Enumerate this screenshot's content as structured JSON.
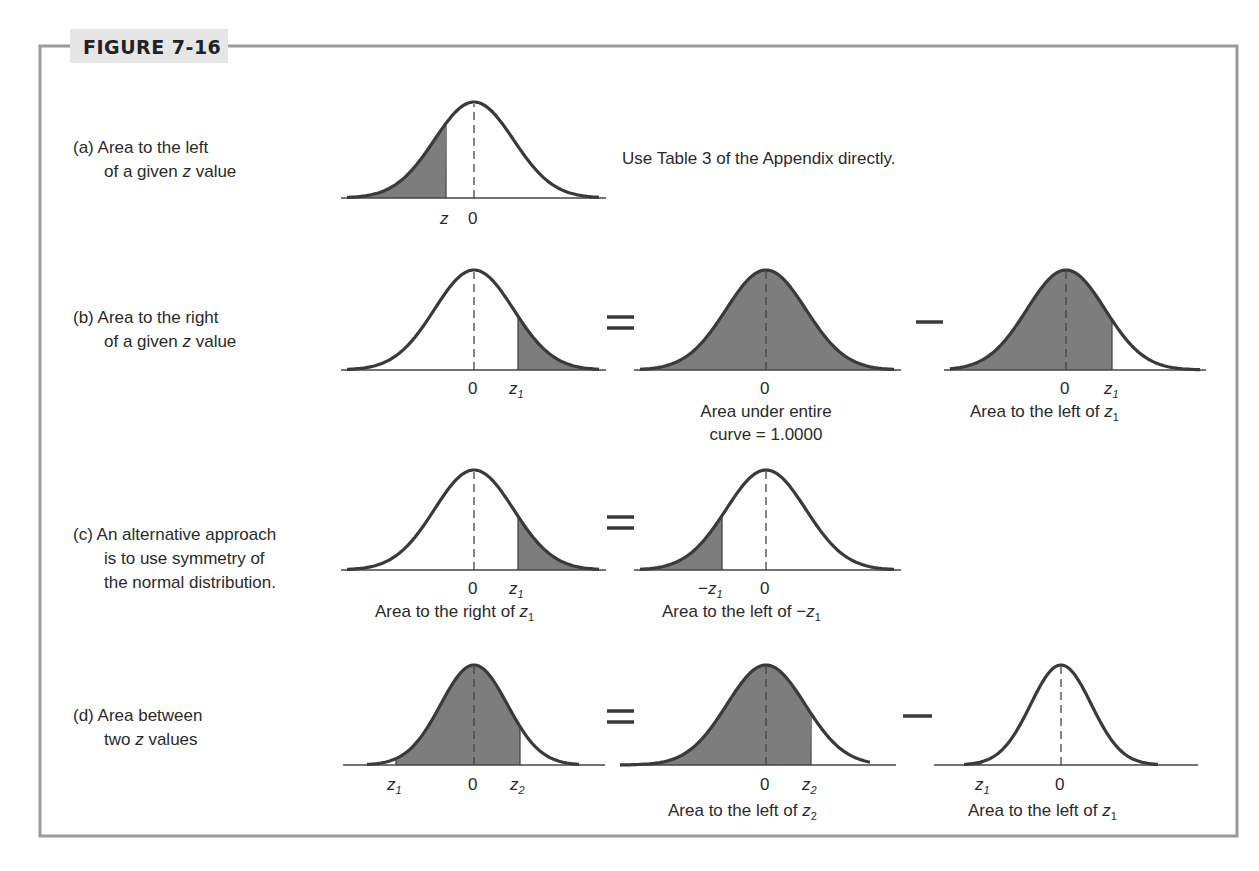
{
  "figure": {
    "title": "FIGURE 7-16",
    "colors": {
      "frame": "#9a9a9a",
      "header_bg": "#e6e6e6",
      "shade": "#7d7d7d",
      "curve": "#3a3a3a"
    }
  },
  "rows": [
    {
      "id": "a",
      "label_lines": [
        "(a) Area to the left",
        "of a given z value"
      ],
      "note": "Use Table 3 of the Appendix directly.",
      "panels": [
        {
          "shade": "left",
          "z_left": "z",
          "ticks": [
            "z",
            "0"
          ],
          "caption": []
        }
      ],
      "operators": []
    },
    {
      "id": "b",
      "label_lines": [
        "(b) Area to the right",
        "of a given z value"
      ],
      "panels": [
        {
          "shade": "right",
          "ticks": [
            "0",
            "z1"
          ],
          "caption": []
        },
        {
          "shade": "all",
          "ticks": [
            "0"
          ],
          "caption": [
            "Area under entire",
            "curve = 1.0000"
          ]
        },
        {
          "shade": "left",
          "ticks": [
            "0",
            "z1"
          ],
          "caption": [
            "Area to the left of z1"
          ]
        }
      ],
      "operators": [
        "=",
        "−"
      ]
    },
    {
      "id": "c",
      "label_lines": [
        "(c) An alternative approach",
        "is to use symmetry of",
        "the normal distribution."
      ],
      "panels": [
        {
          "shade": "right",
          "ticks": [
            "0",
            "z1"
          ],
          "caption": [
            "Area to the right of z1"
          ]
        },
        {
          "shade": "left",
          "ticks": [
            "−z1",
            "0"
          ],
          "caption": [
            "Area to the left of −z1"
          ]
        }
      ],
      "operators": [
        "="
      ]
    },
    {
      "id": "d",
      "label_lines": [
        "(d) Area between",
        "two z values"
      ],
      "panels": [
        {
          "shade": "between",
          "ticks": [
            "z1",
            "0",
            "z2"
          ],
          "caption": []
        },
        {
          "shade": "left",
          "ticks": [
            "0",
            "z2"
          ],
          "caption": [
            "Area to the left of z2"
          ]
        },
        {
          "shade": "left",
          "ticks": [
            "z1",
            "0"
          ],
          "caption": [
            "Area to the left of z1"
          ]
        }
      ],
      "operators": [
        "=",
        "−"
      ]
    }
  ],
  "text": {
    "a_label_1": "(a) Area to the left",
    "a_label_2_pre": "of a given ",
    "a_label_2_z": "z",
    "a_label_2_post": " value",
    "a_note": "Use Table 3 of the Appendix directly.",
    "b_label_1": "(b) Area to the right",
    "b_label_2_pre": "of a given ",
    "b_label_2_z": "z",
    "b_label_2_post": " value",
    "b_cap2_1": "Area under entire",
    "b_cap2_2": "curve = 1.0000",
    "b_cap3_pre": "Area to the left of ",
    "c_label_1": "(c) An alternative approach",
    "c_label_2": "is to use symmetry of",
    "c_label_3": "the normal distribution.",
    "c_cap1_pre": "Area to the right of ",
    "c_cap2_pre": "Area to the left of −",
    "d_label_1": "(d) Area between",
    "d_label_2_pre": "two ",
    "d_label_2_z": "z",
    "d_label_2_post": " values",
    "d_cap2_pre": "Area to the left of ",
    "d_cap3_pre": "Area to the left of ",
    "zero": "0",
    "z": "z",
    "minus": "−",
    "sub1": "1",
    "sub2": "2",
    "eq": "=",
    "op_minus": "−"
  }
}
